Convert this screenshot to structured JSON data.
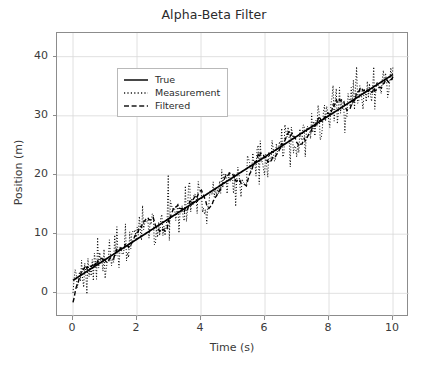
{
  "chart_data": {
    "type": "line",
    "title": "Alpha-Beta Filter",
    "xlabel": "Time (s)",
    "ylabel": "Position (m)",
    "xlim": [
      -0.5,
      10.5
    ],
    "ylim": [
      -4.0,
      44.0
    ],
    "xticks": [
      0,
      2,
      4,
      6,
      8,
      10
    ],
    "yticks": [
      0,
      10,
      20,
      30,
      40
    ],
    "grid": true,
    "legend_position": "upper left",
    "colors": {
      "true": "#000000",
      "measurement": "#000000",
      "filtered": "#000000",
      "grid": "#d8d8d8",
      "spine": "#8c8c8c",
      "text": "#3a3a3a",
      "background": "#ffffff"
    },
    "series": [
      {
        "name": "True",
        "style": "solid",
        "model": "position = 2.2 + 3.48 * t",
        "x": [
          0,
          0.5,
          1,
          1.5,
          2,
          2.5,
          3,
          3.5,
          4,
          4.5,
          5,
          5.5,
          6,
          6.5,
          7,
          7.5,
          8,
          8.5,
          9,
          9.5,
          10
        ],
        "values": [
          2.2,
          3.94,
          5.68,
          7.42,
          9.16,
          10.9,
          12.64,
          14.38,
          16.12,
          17.86,
          19.6,
          21.34,
          23.08,
          24.82,
          26.56,
          28.3,
          30.04,
          31.78,
          33.52,
          35.26,
          37.0
        ]
      },
      {
        "name": "Measurement",
        "style": "dotted",
        "noise_sigma": 2.0,
        "x": [
          0,
          0.5,
          1,
          1.5,
          2,
          2.5,
          3,
          3.5,
          4,
          4.5,
          5,
          5.5,
          6,
          6.5,
          7,
          7.5,
          8,
          8.5,
          9,
          9.5,
          10
        ],
        "values": [
          1.0,
          5.2,
          7.1,
          5.9,
          11.4,
          9.5,
          10.1,
          16.6,
          14.9,
          19.7,
          18.2,
          23.6,
          21.5,
          28.2,
          26.9,
          30.8,
          29.4,
          35.1,
          33.2,
          38.4,
          40.6
        ]
      },
      {
        "name": "Filtered",
        "style": "dashed",
        "x": [
          0,
          0.5,
          1,
          1.5,
          2,
          2.5,
          3,
          3.5,
          4,
          4.5,
          5,
          5.5,
          6,
          6.5,
          7,
          7.5,
          8,
          8.5,
          9,
          9.5,
          10
        ],
        "values": [
          -1.9,
          2.6,
          4.3,
          6.0,
          8.2,
          10.0,
          11.6,
          13.6,
          15.4,
          17.3,
          19.2,
          21.0,
          22.6,
          24.6,
          26.4,
          28.2,
          30.0,
          31.8,
          33.5,
          35.2,
          37.1
        ]
      }
    ]
  },
  "legend": {
    "entries": [
      {
        "label": "True",
        "style": "solid"
      },
      {
        "label": "Measurement",
        "style": "dotted"
      },
      {
        "label": "Filtered",
        "style": "dashed"
      }
    ]
  },
  "axes": {
    "x_tick_labels": [
      "0",
      "2",
      "4",
      "6",
      "8",
      "10"
    ],
    "y_tick_labels": [
      "0",
      "10",
      "20",
      "30",
      "40"
    ]
  }
}
